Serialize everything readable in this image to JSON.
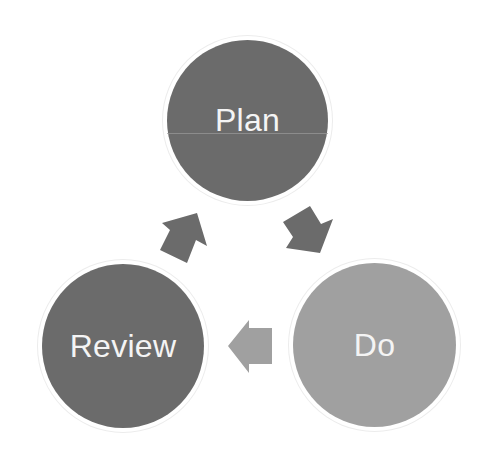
{
  "diagram": {
    "type": "cycle",
    "nodes": [
      {
        "id": "plan",
        "label": "Plan",
        "color": "#6b6b6b"
      },
      {
        "id": "do",
        "label": "Do",
        "color": "#a0a0a0"
      },
      {
        "id": "review",
        "label": "Review",
        "color": "#6b6b6b"
      }
    ],
    "edges": [
      {
        "from": "plan",
        "to": "do",
        "color": "#6b6b6b"
      },
      {
        "from": "do",
        "to": "review",
        "color": "#a0a0a0"
      },
      {
        "from": "review",
        "to": "plan",
        "color": "#6b6b6b"
      }
    ]
  },
  "colors": {
    "dark_node": "#6b6b6b",
    "light_node": "#a0a0a0",
    "background": "#ffffff",
    "text": "#f4f4f4"
  }
}
